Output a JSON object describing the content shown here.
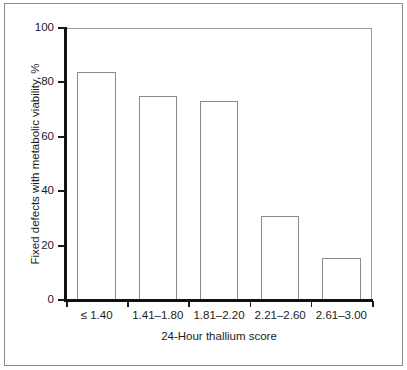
{
  "chart_data": {
    "type": "bar",
    "title": "",
    "subtitle": "",
    "xlabel": "24-Hour thallium score",
    "ylabel": "Fixed defects with metabolic viability, %",
    "categories": [
      "≤ 1.40",
      "1.41–1.80",
      "1.81–2.20",
      "2.21–2.60",
      "2.61–3.00"
    ],
    "values": [
      84,
      75,
      73,
      31,
      15.5
    ],
    "series": [
      {
        "name": "Fixed defects with metabolic viability",
        "values": [
          84,
          75,
          73,
          31,
          15.5
        ]
      }
    ],
    "ylim": [
      0,
      100
    ],
    "yticks": [
      0,
      20,
      40,
      60,
      80,
      100
    ],
    "ytick_labels": [
      "0",
      "20",
      "40",
      "60",
      "80",
      "100"
    ],
    "grid": false,
    "legend": "none",
    "bar_fill_color": "#ffffff",
    "bar_edge_color": "#8a8a8a",
    "axis_color": "#111111",
    "text_color": "#1b1b1b",
    "background_color": "#ffffff",
    "frame_color": "#8d8d8d"
  },
  "figure": {
    "width": 407,
    "height": 370
  }
}
